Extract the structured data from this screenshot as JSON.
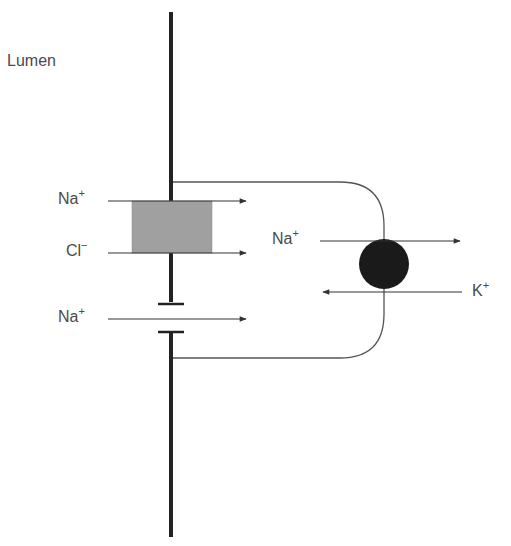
{
  "diagram": {
    "regions": {
      "lumen_label": "Lumen"
    },
    "ions": {
      "na_top": {
        "symbol": "Na",
        "charge": "+"
      },
      "cl": {
        "symbol": "Cl",
        "charge": "−"
      },
      "na_bottom": {
        "symbol": "Na",
        "charge": "+"
      },
      "na_pump": {
        "symbol": "Na",
        "charge": "+"
      },
      "k_pump": {
        "symbol": "K",
        "charge": "+"
      }
    },
    "components": [
      {
        "name": "apical-membrane",
        "type": "thick-vertical-line"
      },
      {
        "name": "cotransporter",
        "type": "gray-rectangle",
        "carries": [
          "Na+",
          "Cl-"
        ]
      },
      {
        "name": "sodium-channel",
        "type": "gap-in-membrane",
        "carries": [
          "Na+"
        ]
      },
      {
        "name": "basolateral-membrane",
        "type": "rounded-outline"
      },
      {
        "name": "na-k-pump",
        "type": "black-circle",
        "carries": [
          "Na+ out",
          "K+ in"
        ]
      }
    ],
    "colors": {
      "membrane": "#222222",
      "cotransporter": "#a0a0a0",
      "pump": "#1a1a1a",
      "arrow": "#333333",
      "text": "#4a4a4a"
    }
  }
}
